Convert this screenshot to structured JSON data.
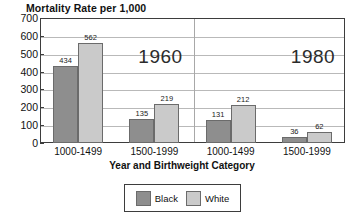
{
  "chart_data": {
    "type": "bar",
    "title": "Mortality Rate per 1,000",
    "xlabel": "Year and Birthweight Category",
    "ylabel": "",
    "ylim": [
      0,
      700
    ],
    "yticks": [
      700,
      600,
      500,
      400,
      300,
      200,
      100,
      0
    ],
    "grid": true,
    "legend_position": "bottom",
    "categories": [
      "1000-1499",
      "1500-1999",
      "1000-1499",
      "1500-1999"
    ],
    "group_labels": [
      "1960",
      "1980"
    ],
    "group_spans": [
      2,
      2
    ],
    "series": [
      {
        "name": "Black",
        "color": "#8e8e8e",
        "values": [
          434,
          135,
          131,
          36
        ]
      },
      {
        "name": "White",
        "color": "#cacaca",
        "values": [
          562,
          219,
          212,
          62
        ]
      }
    ],
    "annotations": [
      {
        "text": "1960",
        "group": 0
      },
      {
        "text": "1980",
        "group": 1
      }
    ]
  },
  "legend": {
    "entries": [
      {
        "label": "Black",
        "color": "#8e8e8e"
      },
      {
        "label": "White",
        "color": "#cacaca"
      }
    ]
  }
}
